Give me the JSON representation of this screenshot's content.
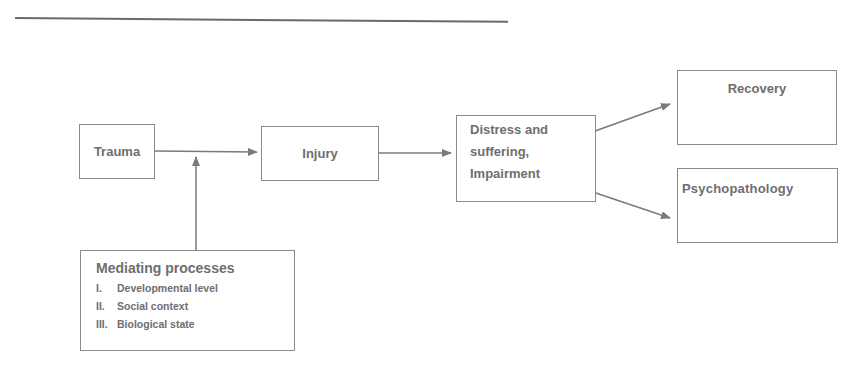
{
  "diagram": {
    "nodes": {
      "trauma": "Trauma",
      "injury": "Injury",
      "distress": [
        "Distress and",
        "suffering,",
        "Impairment"
      ],
      "recovery": "Recovery",
      "psychopathology": "Psychopathology",
      "mediating": {
        "title": "Mediating processes",
        "items": [
          {
            "num": "I.",
            "label": "Developmental level"
          },
          {
            "num": "II.",
            "label": "Social context"
          },
          {
            "num": "III.",
            "label": "Biological state"
          }
        ]
      }
    },
    "edges": [
      {
        "from": "trauma",
        "to": "injury"
      },
      {
        "from": "mediating",
        "to": "trauma-injury-edge"
      },
      {
        "from": "injury",
        "to": "distress"
      },
      {
        "from": "distress",
        "to": "recovery"
      },
      {
        "from": "distress",
        "to": "psychopathology"
      }
    ],
    "colors": {
      "line": "#7a7a7a",
      "text": "#6e6e6e",
      "border": "#8a8a8a"
    }
  }
}
